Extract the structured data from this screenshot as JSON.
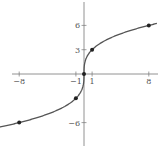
{
  "chart_data": {
    "type": "line",
    "title": "",
    "xlabel": "",
    "ylabel": "",
    "function": "y = 3 * cbrt(x)",
    "xlim": [
      -10,
      10
    ],
    "ylim": [
      -9,
      9
    ],
    "grid": false,
    "x_ticks": [
      -8,
      -1,
      1,
      8
    ],
    "y_ticks": [
      6,
      3,
      -6
    ],
    "x_tick_labels": [
      "-8",
      "-1",
      "1",
      "8"
    ],
    "y_tick_labels": [
      "6",
      "3",
      "-6"
    ],
    "points": [
      {
        "x": -8,
        "y": -6
      },
      {
        "x": -1,
        "y": -3
      },
      {
        "x": 0,
        "y": 0
      },
      {
        "x": 1,
        "y": 3
      },
      {
        "x": 8,
        "y": 6
      }
    ],
    "curve_color": "#555555",
    "axis_color": "#777777",
    "point_color": "#222222"
  }
}
